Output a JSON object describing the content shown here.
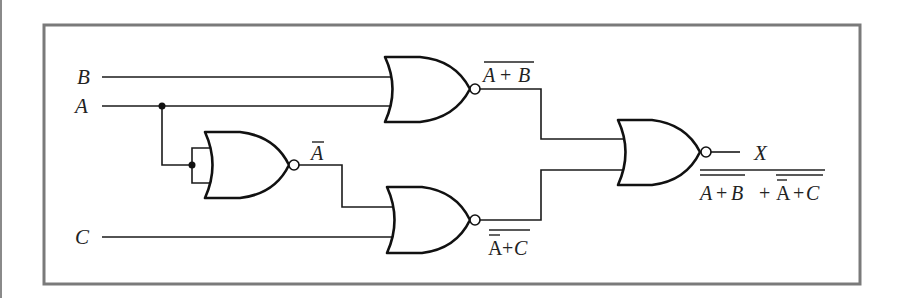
{
  "diagram": {
    "type": "logic-circuit",
    "gate_type": "NOR",
    "inputs": [
      {
        "name": "B",
        "label": "B"
      },
      {
        "name": "A",
        "label": "A"
      },
      {
        "name": "C",
        "label": "C"
      }
    ],
    "gates": [
      {
        "id": "nor-top",
        "inputs": [
          "B",
          "A"
        ],
        "output_label": "A + B",
        "output_overlined": true
      },
      {
        "id": "nor-inverter",
        "inputs": [
          "A",
          "A"
        ],
        "output_label": "A",
        "output_overlined": true
      },
      {
        "id": "nor-bottom",
        "inputs": [
          "Ā",
          "C"
        ],
        "output_label_a": "A",
        "output_label_plus": "+",
        "output_label_c": "C"
      },
      {
        "id": "nor-final",
        "inputs": [
          "nor-top",
          "nor-bottom"
        ],
        "output": "X"
      }
    ],
    "output": {
      "label": "X",
      "expression": {
        "term1_a": "A",
        "term1_plus": "+",
        "term1_b": "B",
        "join": "+",
        "term2_a": "A",
        "term2_plus": "+",
        "term2_c": "C"
      }
    },
    "labels": {
      "top_out_a": "A",
      "top_out_plus": "+",
      "top_out_b": "B",
      "inverter_out": "A",
      "bottom_out_a": "A",
      "bottom_out_plus": "+",
      "bottom_out_c": "C"
    },
    "colors": {
      "frame": "#7a7a7a",
      "ink": "#111111",
      "background": "#ffffff"
    }
  }
}
